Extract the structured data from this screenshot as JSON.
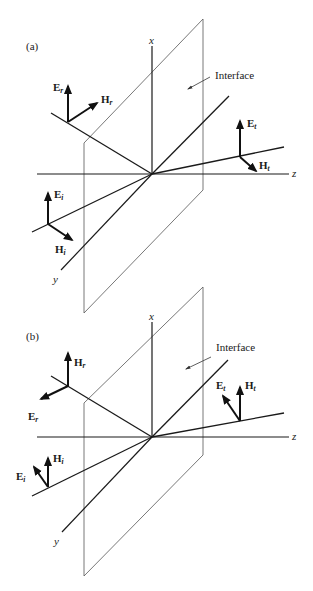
{
  "figure": {
    "colors": {
      "ink": "#1a1a1a",
      "plane": "#555555",
      "background": "#ffffff"
    },
    "panels": [
      {
        "id": "a",
        "label": "(a)",
        "interface_label": "Interface",
        "axes": {
          "x": "x",
          "y": "y",
          "z": "z"
        },
        "vectors": {
          "reflected": {
            "E": "E",
            "E_sub": "r",
            "H": "H",
            "H_sub": "r"
          },
          "transmitted": {
            "E": "E",
            "E_sub": "t",
            "H": "H",
            "H_sub": "t"
          },
          "incident": {
            "E": "E",
            "E_sub": "i",
            "H": "H",
            "H_sub": "i"
          }
        }
      },
      {
        "id": "b",
        "label": "(b)",
        "interface_label": "Interface",
        "axes": {
          "x": "x",
          "y": "y",
          "z": "z"
        },
        "vectors": {
          "reflected": {
            "E": "E",
            "E_sub": "r",
            "H": "H",
            "H_sub": "r"
          },
          "transmitted": {
            "E": "E",
            "E_sub": "t",
            "H": "H",
            "H_sub": "t"
          },
          "incident": {
            "E": "E",
            "E_sub": "i",
            "H": "H",
            "H_sub": "i"
          }
        }
      }
    ]
  }
}
